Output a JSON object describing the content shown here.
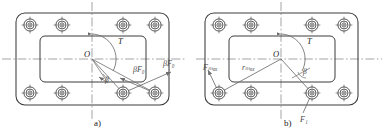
{
  "figure": {
    "type": "engineering-diagram",
    "background_color": "#ffffff",
    "line_color": "#3c3c3c",
    "centerline_color": "#8a8a8a",
    "force_line_color": "#6e6e6e",
    "text_color": "#1a1a1a"
  },
  "captions": {
    "a": "a)",
    "b": "b)"
  },
  "panel_a": {
    "name": "panel-a",
    "center_label": "O",
    "torque_label": "T",
    "angle_label": "β",
    "force_labels": [
      "βF₀",
      "βF₀"
    ],
    "bolt_count": 8,
    "bolt_symbol": "bolt-crosshair",
    "bolts": [
      {
        "id": "a-bolt-1",
        "x": 30,
        "y": 25
      },
      {
        "id": "a-bolt-2",
        "x": 62,
        "y": 25
      },
      {
        "id": "a-bolt-3",
        "x": 123,
        "y": 25
      },
      {
        "id": "a-bolt-4",
        "x": 155,
        "y": 25
      },
      {
        "id": "a-bolt-5",
        "x": 30,
        "y": 93
      },
      {
        "id": "a-bolt-6",
        "x": 62,
        "y": 93
      },
      {
        "id": "a-bolt-7",
        "x": 123,
        "y": 93
      },
      {
        "id": "a-bolt-8",
        "x": 155,
        "y": 93
      }
    ],
    "outer_plate": {
      "x": 16,
      "y": 13,
      "w": 153,
      "h": 92,
      "radius": 9
    },
    "inner_window": {
      "x": 40,
      "y": 36,
      "w": 106,
      "h": 46,
      "radius": 5
    },
    "center": {
      "x": 92,
      "y": 59
    }
  },
  "panel_b": {
    "name": "panel-b",
    "center_label": "O",
    "torque_label": "T",
    "angle_label": "β",
    "force_labels": [
      "Fₘₐₓ",
      "F₁"
    ],
    "radius_label": "rₘₐₓ",
    "bolt_count": 8,
    "bolt_symbol": "bolt-crosshair",
    "bolts": [
      {
        "id": "b-bolt-1",
        "x": 219,
        "y": 25
      },
      {
        "id": "b-bolt-2",
        "x": 251,
        "y": 25
      },
      {
        "id": "b-bolt-3",
        "x": 312,
        "y": 25
      },
      {
        "id": "b-bolt-4",
        "x": 344,
        "y": 25
      },
      {
        "id": "b-bolt-5",
        "x": 219,
        "y": 93
      },
      {
        "id": "b-bolt-6",
        "x": 251,
        "y": 93
      },
      {
        "id": "b-bolt-7",
        "x": 312,
        "y": 93
      },
      {
        "id": "b-bolt-8",
        "x": 344,
        "y": 93
      }
    ],
    "outer_plate": {
      "x": 205,
      "y": 13,
      "w": 153,
      "h": 92,
      "radius": 9
    },
    "inner_window": {
      "x": 229,
      "y": 36,
      "w": 106,
      "h": 46,
      "radius": 5
    },
    "center": {
      "x": 281,
      "y": 59
    }
  }
}
